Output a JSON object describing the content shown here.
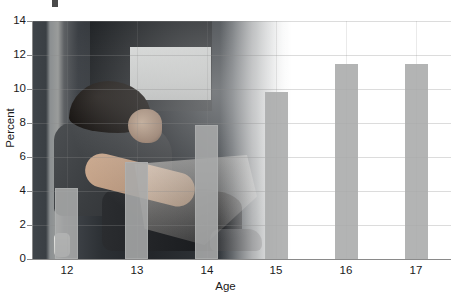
{
  "figure": {
    "title_fragment_visible": true,
    "background_photo": {
      "description": "teenage-boy-sitting-on-floor-photo",
      "interactable": false
    }
  },
  "chart_data": {
    "type": "bar",
    "title": "",
    "xlabel": "Age",
    "ylabel": "Percent",
    "categories": [
      "12",
      "13",
      "14",
      "15",
      "16",
      "17"
    ],
    "values": [
      4.2,
      5.7,
      7.9,
      9.8,
      11.5,
      11.5
    ],
    "ylim": [
      0,
      14
    ],
    "yticks": [
      0,
      2,
      4,
      6,
      8,
      10,
      12,
      14
    ],
    "ytick_labels": [
      "0",
      "2",
      "4",
      "6",
      "8",
      "10",
      "12",
      "14"
    ],
    "xtick_labels": [
      "12",
      "13",
      "14",
      "15",
      "16",
      "17"
    ],
    "grid": true,
    "legend": false,
    "bar_color": "#a8aaaa",
    "axis_color": "#8a8a8a",
    "text_color": "#1a1a1a"
  }
}
